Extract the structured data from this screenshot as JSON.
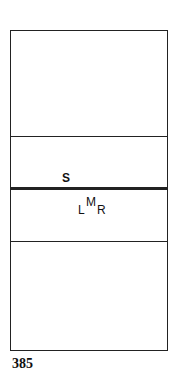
{
  "diagram": {
    "regions": [
      "top",
      "upper-middle",
      "lower-middle",
      "bottom"
    ],
    "labels": {
      "s": "S",
      "l": "L",
      "m": "M",
      "r": "R"
    }
  },
  "page_number": "385"
}
